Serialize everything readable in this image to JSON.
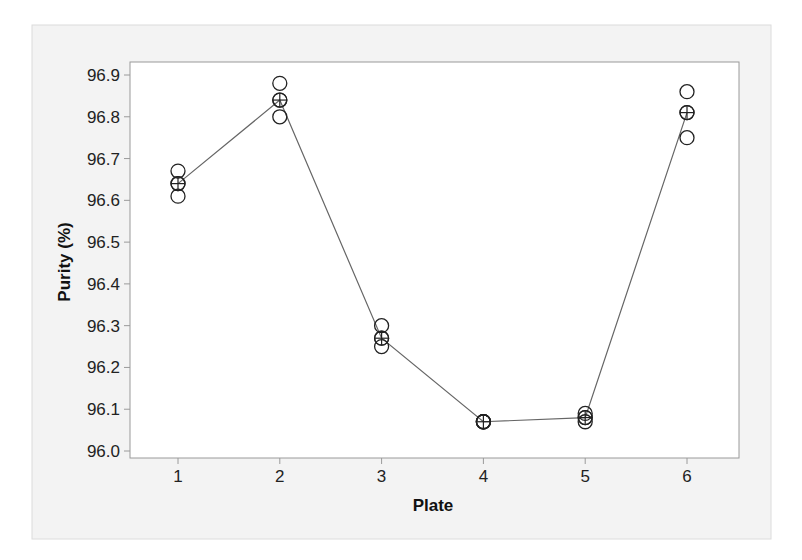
{
  "chart_data": {
    "type": "scatter",
    "subtype": "individual value plot with connected means",
    "title": "",
    "xlabel": "Plate",
    "ylabel": "Purity (%)",
    "categories": [
      "1",
      "2",
      "3",
      "4",
      "5",
      "6"
    ],
    "x_ticks": [
      1,
      2,
      3,
      4,
      5,
      6
    ],
    "y_ticks": [
      96.0,
      96.1,
      96.2,
      96.3,
      96.4,
      96.5,
      96.6,
      96.7,
      96.8,
      96.9
    ],
    "y_tick_labels": [
      "96.0",
      "96.1",
      "96.2",
      "96.3",
      "96.4",
      "96.5",
      "96.6",
      "96.7",
      "96.8",
      "96.9"
    ],
    "ylim": [
      96.0,
      96.9
    ],
    "xlim": [
      0.5,
      6.5
    ],
    "grid": false,
    "legend": null,
    "series": [
      {
        "name": "Individual values",
        "marker": "open-circle",
        "points": [
          {
            "plate": 1,
            "values": [
              96.67,
              96.64,
              96.61
            ]
          },
          {
            "plate": 2,
            "values": [
              96.88,
              96.84,
              96.8
            ]
          },
          {
            "plate": 3,
            "values": [
              96.3,
              96.27,
              96.25
            ]
          },
          {
            "plate": 4,
            "values": [
              96.07,
              96.07,
              96.07
            ]
          },
          {
            "plate": 5,
            "values": [
              96.09,
              96.08,
              96.07
            ]
          },
          {
            "plate": 6,
            "values": [
              96.86,
              96.81,
              96.75
            ]
          }
        ]
      },
      {
        "name": "Mean",
        "marker": "circle-cross",
        "line": true,
        "x": [
          1,
          2,
          3,
          4,
          5,
          6
        ],
        "values": [
          96.64,
          96.84,
          96.27,
          96.07,
          96.08,
          96.81
        ]
      }
    ],
    "colors": {
      "panel_bg": "#f3f3f3",
      "plot_bg": "#ffffff",
      "frame": "#9a9a9a",
      "marker": "#222222",
      "line": "#666666"
    }
  }
}
